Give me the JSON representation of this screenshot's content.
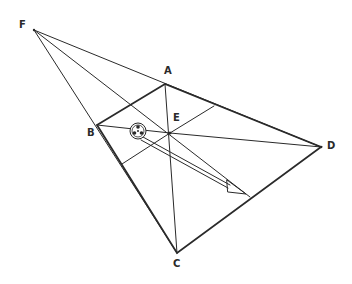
{
  "diagram": {
    "points": {
      "F": {
        "label": "F",
        "x": 34,
        "y": 30
      },
      "A": {
        "label": "A",
        "x": 165,
        "y": 84
      },
      "B": {
        "label": "B",
        "x": 97,
        "y": 125
      },
      "E": {
        "label": "E",
        "x": 170,
        "y": 133
      },
      "D": {
        "label": "D",
        "x": 321,
        "y": 147
      },
      "C": {
        "label": "C",
        "x": 177,
        "y": 253
      }
    },
    "labels": {
      "F": "F",
      "A": "A",
      "B": "B",
      "C": "C",
      "D": "D",
      "E": "E"
    },
    "objects": {
      "ball": "soccer-ball",
      "arrow": "hollow-arrow"
    },
    "colors": {
      "line": "#2a2a2a",
      "background": "#ffffff"
    }
  }
}
